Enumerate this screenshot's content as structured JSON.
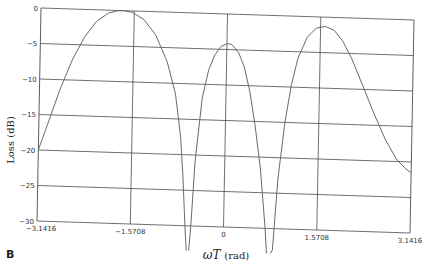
{
  "panel_label": "B",
  "chart_data": {
    "type": "line",
    "title": "",
    "xlabel": "ωT (rad)",
    "xlabel_parts": {
      "var": "ωT",
      "unit": "(rad)"
    },
    "ylabel": "Loss (dB)",
    "xlim": [
      -3.1416,
      3.1416
    ],
    "ylim": [
      -30,
      0
    ],
    "grid": true,
    "legend": "none",
    "x_ticks": [
      -3.1416,
      -1.5708,
      0,
      1.5708,
      3.1416
    ],
    "x_tick_labels": [
      "-3.1416",
      "-1.5708",
      "0",
      "1.5708",
      "3.1416"
    ],
    "y_ticks": [
      0,
      -5,
      -10,
      -15,
      -20,
      -25,
      -30
    ],
    "y_tick_labels": [
      "0",
      "-5",
      "-10",
      "-15",
      "-20",
      "-25",
      "-30"
    ],
    "series": [
      {
        "name": "Loss",
        "x": [
          -3.1416,
          -3.0,
          -2.8,
          -2.6,
          -2.4,
          -2.2,
          -2.0,
          -1.85,
          -1.75,
          -1.6,
          -1.4,
          -1.2,
          -1.0,
          -0.85,
          -0.75,
          -0.7,
          -0.65,
          -0.62,
          -0.58,
          -0.55,
          -0.5,
          -0.4,
          -0.3,
          -0.2,
          -0.1,
          0.0,
          0.05,
          0.1,
          0.2,
          0.3,
          0.4,
          0.5,
          0.6,
          0.7,
          0.73,
          0.76,
          0.8,
          0.83,
          0.9,
          1.0,
          1.1,
          1.2,
          1.35,
          1.5,
          1.65,
          1.8,
          1.95,
          2.1,
          2.3,
          2.5,
          2.7,
          2.9,
          3.05,
          3.1416
        ],
        "y": [
          -20,
          -16.5,
          -11.5,
          -7.2,
          -3.9,
          -1.6,
          -0.4,
          -0.05,
          0,
          -0.2,
          -1.2,
          -3.3,
          -7.0,
          -11.5,
          -17.5,
          -23,
          -30,
          -35,
          -35,
          -30,
          -21,
          -12,
          -8,
          -5.8,
          -4.6,
          -4.2,
          -4.2,
          -4.4,
          -5.4,
          -7.4,
          -10.8,
          -15.6,
          -21.5,
          -30,
          -35,
          -40,
          -40,
          -33,
          -23,
          -15,
          -9.6,
          -5.9,
          -2.9,
          -1.6,
          -1.3,
          -1.8,
          -3.3,
          -5.6,
          -9.5,
          -13.4,
          -17.0,
          -19.8,
          -21.0,
          -21.5
        ]
      }
    ]
  }
}
